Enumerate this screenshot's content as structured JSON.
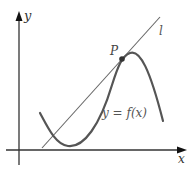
{
  "figure": {
    "type": "tangent-line-diagram",
    "labels": {
      "y_axis": "y",
      "x_axis": "x",
      "point": "P",
      "line": "l",
      "curve": "y = f(x)"
    },
    "colors": {
      "axes": "#222222",
      "curve": "#555555",
      "tangent_line": "#666666",
      "point": "#333333",
      "text": "#555555"
    }
  }
}
